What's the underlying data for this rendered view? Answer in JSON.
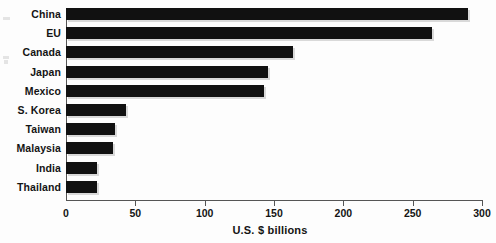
{
  "chart_data": {
    "type": "bar",
    "orientation": "horizontal",
    "title": "",
    "subtitle": "",
    "xlabel": "U.S. $ billions",
    "ylabel": "",
    "categories": [
      "China",
      "EU",
      "Canada",
      "Japan",
      "Mexico",
      "S. Korea",
      "Taiwan",
      "Malaysia",
      "India",
      "Thailand"
    ],
    "values": [
      290,
      264,
      164,
      146,
      143,
      43,
      35,
      34,
      22,
      22
    ],
    "xlim": [
      0,
      300
    ],
    "xticks": [
      0,
      50,
      100,
      150,
      200,
      250,
      300
    ],
    "xtick_labels": [
      "0",
      "50",
      "100",
      "150",
      "200",
      "250",
      "300"
    ],
    "grid": false,
    "legend": null,
    "bar_color": "#111111",
    "axis_color": "#555555",
    "background_color": "#fdfdfd",
    "annotations": []
  },
  "axis": {
    "x_title": "U.S. $ billions"
  },
  "artifacts": {
    "note": ""
  }
}
